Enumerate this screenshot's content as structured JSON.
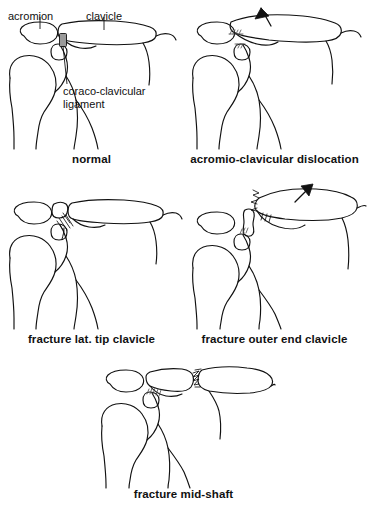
{
  "figure": {
    "background_color": "#ffffff",
    "ink_color": "#111111",
    "ligament_color": "#9a9a9a"
  },
  "annotations": {
    "acromion": "acromion",
    "clavicle": "clavicle",
    "ligament_line1": "coraco-clavicular",
    "ligament_line2": "ligament"
  },
  "panels": [
    {
      "id": "normal",
      "caption": "normal",
      "row": 1,
      "column": 1,
      "has_arrow": false,
      "has_fracture": false,
      "ligament_intact": true
    },
    {
      "id": "ac-dislocation",
      "caption": "acromio-clavicular dislocation",
      "row": 1,
      "column": 2,
      "has_arrow": true,
      "arrow_direction": "up",
      "has_fracture": false,
      "ligament_intact": false
    },
    {
      "id": "fracture-lat-tip",
      "caption": "fracture lat. tip clavicle",
      "row": 2,
      "column": 1,
      "has_arrow": false,
      "has_fracture": true,
      "fracture_site": "lateral tip",
      "ligament_intact": true
    },
    {
      "id": "fracture-outer-end",
      "caption": "fracture outer end clavicle",
      "row": 2,
      "column": 2,
      "has_arrow": true,
      "arrow_direction": "up",
      "has_fracture": true,
      "fracture_site": "outer end",
      "ligament_intact": true
    },
    {
      "id": "fracture-mid-shaft",
      "caption": "fracture mid-shaft",
      "row": 3,
      "column": 1,
      "has_arrow": false,
      "has_fracture": true,
      "fracture_site": "mid shaft",
      "ligament_intact": true
    }
  ]
}
